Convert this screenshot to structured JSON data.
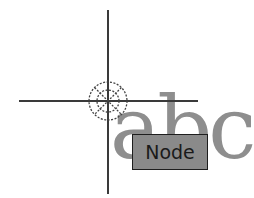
{
  "canvas": {
    "crosshair": {
      "vertical_x": 108,
      "horizontal_y": 101,
      "color": "#3a3a3a"
    },
    "snap_marker": {
      "type": "node-snap",
      "icon": "node-snap-icon"
    },
    "text_object": {
      "content": "abc",
      "color": "#8e8e8e"
    },
    "tooltip": {
      "label": "Node",
      "background": "#8a8a8a",
      "border": "#1e1e1e"
    }
  }
}
